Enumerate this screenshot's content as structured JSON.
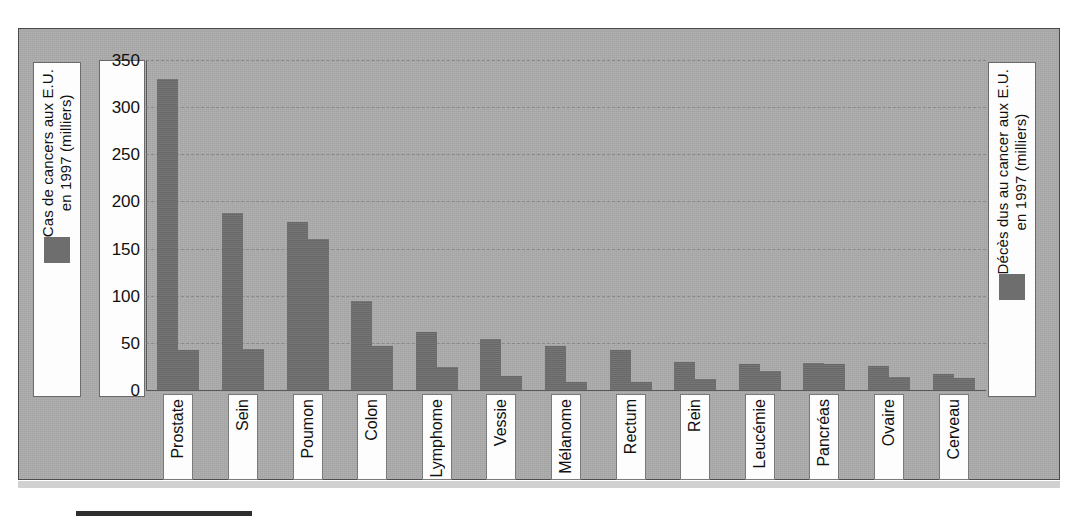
{
  "legend": {
    "left": {
      "label": "Cas de cancers aux E.U.\nen 1997 (milliers)",
      "swatch_color": "#6e6e6e",
      "series_name": "Cas de cancers aux E.U. en 1997 (milliers)"
    },
    "right": {
      "label": "Décès dus au cancer aux E.U.\nen 1997 (milliers)",
      "swatch_color": "#6e6e6e",
      "series_name": "Décès dus au cancer aux E.U. en 1997 (milliers)"
    }
  },
  "axis": {
    "y_ticks": [
      "350",
      "300",
      "250",
      "200",
      "150",
      "100",
      "50",
      "0"
    ],
    "y_min": 0,
    "y_max": 350,
    "y_step": 50
  },
  "colors": {
    "plot_background": "#aaaaaa",
    "page_background": "#ffffff",
    "bar": "#6e6e6e",
    "gridline": "#7d7d7d",
    "frame_border": "#4c4c4c",
    "label_box": "#fdfdfd"
  },
  "chart_data": {
    "type": "bar",
    "title": "",
    "xlabel": "",
    "ylabel": "Cas de cancers aux E.U. en 1997 (milliers)",
    "ylabel_right": "Décès dus au cancer aux E.U. en 1997 (milliers)",
    "ylim": [
      0,
      350
    ],
    "ytick_step": 50,
    "grid": true,
    "grid_style": "dashed-horizontal",
    "legend_position": "outside-left-and-right",
    "categories": [
      "Prostate",
      "Sein",
      "Poumon",
      "Colon",
      "Lymphome",
      "Vessie",
      "Mélanome",
      "Rectum",
      "Rein",
      "Leucémie",
      "Pancréas",
      "Ovaire",
      "Cerveau"
    ],
    "series": [
      {
        "name": "Cas de cancers aux E.U. en 1997 (milliers)",
        "color": "#6e6e6e",
        "values": [
          330,
          188,
          178,
          94,
          62,
          54,
          47,
          42,
          30,
          28,
          29,
          26,
          17
        ]
      },
      {
        "name": "Décès dus au cancer aux E.U. en 1997 (milliers)",
        "color": "#6e6e6e",
        "values": [
          42,
          44,
          160,
          47,
          24,
          15,
          8,
          9,
          12,
          20,
          28,
          14,
          13
        ]
      }
    ]
  }
}
